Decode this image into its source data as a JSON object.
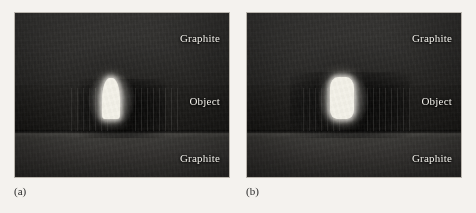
{
  "figure": {
    "panels": [
      {
        "caption": "(a)",
        "regions": {
          "top": "Graphite",
          "middle": "Object",
          "bottom": "Graphite"
        }
      },
      {
        "caption": "(b)",
        "regions": {
          "top": "Graphite",
          "middle": "Object",
          "bottom": "Graphite"
        }
      }
    ],
    "colors": {
      "page_background": "#f4f2ee",
      "panel_border": "#b9b5ae",
      "graphite_upper": "#2e2d2b",
      "object_band": "#191816",
      "graphite_lower": "#343230",
      "label_text": "#f2f0ea",
      "bright_object": "#f3f1e8",
      "caption_text": "#2a2a2a"
    }
  }
}
